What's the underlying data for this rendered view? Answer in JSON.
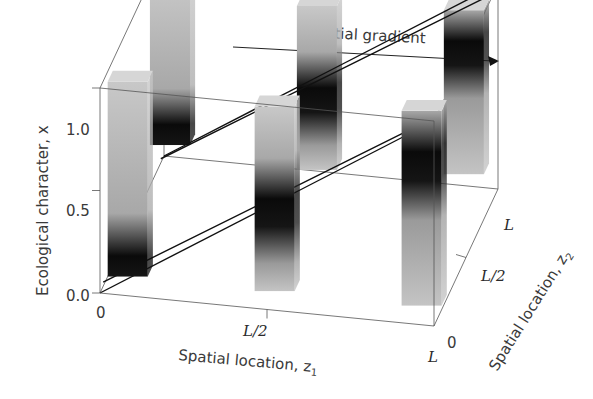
{
  "chart_data": {
    "type": "bar3d",
    "title": "Spatial gradient",
    "annotation_arrow": "Spatial gradient",
    "zlabel": "Ecological character, x",
    "zlabel_var": "x",
    "x1label": "Spatial location, z",
    "x1label_sub": "1",
    "x2label": "Spatial location, z",
    "x2label_sub": "2",
    "z_ticks": [
      "0.0",
      "0.5",
      "1.0"
    ],
    "z1_ticks": [
      "0",
      "L/2",
      "L"
    ],
    "z2_ticks": [
      "0",
      "L/2",
      "L"
    ],
    "zlim": [
      0,
      1
    ],
    "gradient_planes": [
      {
        "name": "front-plane",
        "values_at": [
          0,
          0.5,
          1
        ],
        "description": "linear gradient in x along z1 at z2 = 0"
      },
      {
        "name": "back-plane",
        "values_at": [
          0,
          0.5,
          1
        ],
        "description": "linear gradient in x along z1 at z2 = L"
      }
    ],
    "bars": [
      {
        "z1": "0",
        "z2": "0",
        "bottom": 0.0,
        "top": 0.95,
        "dark_at": 0.1
      },
      {
        "z1": "L/2",
        "z2": "0",
        "bottom": 0.0,
        "top": 0.9,
        "dark_at": 0.45
      },
      {
        "z1": "L",
        "z2": "0",
        "bottom": 0.0,
        "top": 0.95,
        "dark_at": 0.75
      },
      {
        "z1": "0",
        "z2": "L",
        "bottom": 0.2,
        "top": 1.0,
        "dark_at": 0.3
      },
      {
        "z1": "L/2",
        "z2": "L",
        "bottom": 0.15,
        "top": 0.95,
        "dark_at": 0.55
      },
      {
        "z1": "L",
        "z2": "L",
        "bottom": 0.2,
        "top": 1.0,
        "dark_at": 0.85
      }
    ]
  }
}
